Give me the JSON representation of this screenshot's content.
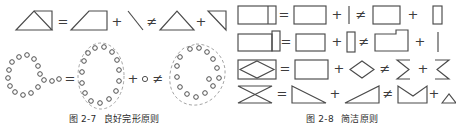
{
  "page": {
    "background": "#ffffff",
    "stroke_color": "#4a4a4a",
    "dashed_color": "#9a9a9a"
  },
  "figures": [
    {
      "id": "figure-2-7",
      "caption_number": "图 2-7",
      "caption_title": "良好完形原则",
      "rows": [
        {
          "id": "row-shapes",
          "tokens": [
            {
              "kind": "shape",
              "name": "triangle-in-box-composite"
            },
            {
              "kind": "operator",
              "name": "equals",
              "glyph": "="
            },
            {
              "kind": "shape",
              "name": "right-trapezoid"
            },
            {
              "kind": "operator",
              "name": "plus",
              "glyph": "+"
            },
            {
              "kind": "shape",
              "name": "diagonal-stroke"
            },
            {
              "kind": "operator",
              "name": "not-equals",
              "glyph": "≠"
            },
            {
              "kind": "shape",
              "name": "triangle"
            },
            {
              "kind": "operator",
              "name": "plus",
              "glyph": "+"
            },
            {
              "kind": "shape",
              "name": "right-triangle"
            }
          ]
        },
        {
          "id": "row-dots",
          "tokens": [
            {
              "kind": "shape",
              "name": "two-overlapping-dot-rings"
            },
            {
              "kind": "operator",
              "name": "equals",
              "glyph": "="
            },
            {
              "kind": "shape",
              "name": "dot-ellipse-grouped"
            },
            {
              "kind": "operator",
              "name": "plus",
              "glyph": "+"
            },
            {
              "kind": "shape",
              "name": "single-dot"
            },
            {
              "kind": "operator",
              "name": "not-equals",
              "glyph": "≠"
            },
            {
              "kind": "shape",
              "name": "dot-blob-irregular"
            }
          ]
        }
      ]
    },
    {
      "id": "figure-2-8",
      "caption_number": "图 2-8",
      "caption_title": "简洁原则",
      "rows": [
        {
          "id": "row-1",
          "tokens": [
            {
              "kind": "shape",
              "name": "rect-with-inner-divider"
            },
            {
              "kind": "operator",
              "name": "equals",
              "glyph": "="
            },
            {
              "kind": "shape",
              "name": "rect-wide"
            },
            {
              "kind": "operator",
              "name": "plus",
              "glyph": "+"
            },
            {
              "kind": "shape",
              "name": "vertical-bar"
            },
            {
              "kind": "operator",
              "name": "not-equals",
              "glyph": "≠"
            },
            {
              "kind": "shape",
              "name": "rect-square"
            },
            {
              "kind": "operator",
              "name": "plus",
              "glyph": "+"
            },
            {
              "kind": "shape",
              "name": "narrow-rect"
            }
          ]
        },
        {
          "id": "row-2",
          "tokens": [
            {
              "kind": "shape",
              "name": "rect-with-tall-flap"
            },
            {
              "kind": "operator",
              "name": "equals",
              "glyph": "="
            },
            {
              "kind": "shape",
              "name": "rect-wide"
            },
            {
              "kind": "operator",
              "name": "plus",
              "glyph": "+"
            },
            {
              "kind": "shape",
              "name": "narrow-tall-rect"
            },
            {
              "kind": "operator",
              "name": "not-equals",
              "glyph": "≠"
            },
            {
              "kind": "shape",
              "name": "notched-rect"
            },
            {
              "kind": "operator",
              "name": "plus",
              "glyph": "+"
            },
            {
              "kind": "shape",
              "name": "vertical-bar"
            }
          ]
        },
        {
          "id": "row-3",
          "tokens": [
            {
              "kind": "shape",
              "name": "rect-with-inner-diamond"
            },
            {
              "kind": "operator",
              "name": "equals",
              "glyph": "="
            },
            {
              "kind": "shape",
              "name": "rect-wide"
            },
            {
              "kind": "operator",
              "name": "plus",
              "glyph": "+"
            },
            {
              "kind": "shape",
              "name": "diamond"
            },
            {
              "kind": "operator",
              "name": "not-equals",
              "glyph": "≠"
            },
            {
              "kind": "shape",
              "name": "left-bracket-chevron"
            },
            {
              "kind": "operator",
              "name": "plus",
              "glyph": "+"
            },
            {
              "kind": "shape",
              "name": "right-bracket-chevron"
            }
          ]
        },
        {
          "id": "row-4",
          "tokens": [
            {
              "kind": "shape",
              "name": "bowtie"
            },
            {
              "kind": "operator",
              "name": "equals",
              "glyph": "="
            },
            {
              "kind": "shape",
              "name": "triangle-down-right"
            },
            {
              "kind": "operator",
              "name": "plus",
              "glyph": "+"
            },
            {
              "kind": "shape",
              "name": "triangle-up-right"
            },
            {
              "kind": "operator",
              "name": "not-equals",
              "glyph": "≠"
            },
            {
              "kind": "shape",
              "name": "v-notch-top"
            },
            {
              "kind": "operator",
              "name": "plus",
              "glyph": "+"
            },
            {
              "kind": "shape",
              "name": "flat-triangle"
            }
          ]
        }
      ]
    }
  ]
}
